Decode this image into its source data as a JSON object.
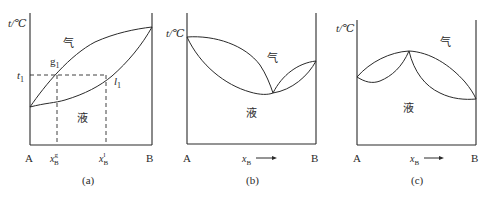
{
  "figure": {
    "panels": [
      {
        "id": "a",
        "caption": "(a)",
        "y_axis_label": "t/℃",
        "x_left_label": "A",
        "x_right_label": "B",
        "vapor_label": "气",
        "liquid_label": "液",
        "temperature_marker": "t",
        "temperature_marker_sub": "1",
        "vapor_point": "g",
        "vapor_point_sub": "1",
        "liquid_point": "l",
        "liquid_point_sub": "1",
        "x_gas_label": "x",
        "x_gas_sub": "B",
        "x_gas_sup": "g",
        "x_liq_label": "x",
        "x_liq_sub": "B",
        "x_liq_sup": "l"
      },
      {
        "id": "b",
        "caption": "(b)",
        "y_axis_label": "t/℃",
        "x_left_label": "A",
        "x_right_label": "B",
        "x_axis_label": "x",
        "x_axis_sub": "B",
        "vapor_label": "气",
        "liquid_label": "液"
      },
      {
        "id": "c",
        "caption": "(c)",
        "y_axis_label": "t/℃",
        "x_left_label": "A",
        "x_right_label": "B",
        "x_axis_label": "x",
        "x_axis_sub": "B",
        "vapor_label": "气",
        "liquid_label": "液"
      }
    ],
    "colors": {
      "line": "#2a2a2a",
      "background": "#ffffff"
    }
  }
}
